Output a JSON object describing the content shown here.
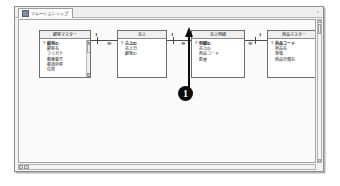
{
  "window": {
    "document_tab_label": "リレーションシップ",
    "tab_icon": "relationship-icon",
    "close_label": "×"
  },
  "canvas": {
    "tables": [
      {
        "name": "顧客マスター",
        "fields": [
          {
            "label": "顧客ID",
            "primary_key": true
          },
          {
            "label": "顧客名",
            "primary_key": false
          },
          {
            "label": "フリガナ",
            "primary_key": false
          },
          {
            "label": "郵便番号",
            "primary_key": false
          },
          {
            "label": "都道府県",
            "primary_key": false
          },
          {
            "label": "住所",
            "primary_key": false
          }
        ],
        "has_scrollbar": true
      },
      {
        "name": "売上",
        "fields": [
          {
            "label": "売上ID",
            "primary_key": true
          },
          {
            "label": "売上日",
            "primary_key": false
          },
          {
            "label": "顧客ID",
            "primary_key": false
          }
        ],
        "has_scrollbar": false
      },
      {
        "name": "売上明細",
        "fields": [
          {
            "label": "明細ID",
            "primary_key": true
          },
          {
            "label": "売上ID",
            "primary_key": false
          },
          {
            "label": "商品コード",
            "primary_key": false
          },
          {
            "label": "数量",
            "primary_key": false
          }
        ],
        "has_scrollbar": false
      },
      {
        "name": "商品マスター",
        "fields": [
          {
            "label": "商品コード",
            "primary_key": true
          },
          {
            "label": "商品名",
            "primary_key": false
          },
          {
            "label": "単価",
            "primary_key": false
          },
          {
            "label": "商品分類名",
            "primary_key": false
          }
        ],
        "has_scrollbar": false
      }
    ],
    "relationships": [
      {
        "from_side_mark": "1",
        "to_side_mark": "∞"
      },
      {
        "from_side_mark": "1",
        "to_side_mark": "∞"
      },
      {
        "from_side_mark": "∞",
        "to_side_mark": "1"
      }
    ],
    "annotations": [
      {
        "marker": "1",
        "points_to": "商品マスター-relationship"
      }
    ]
  },
  "colors": {
    "annotation": "#0b0b0b",
    "table_border": "#6e6e6e",
    "table_header": "#efefef",
    "canvas": "#fafafa",
    "window_frame": "#8e8e8e"
  }
}
